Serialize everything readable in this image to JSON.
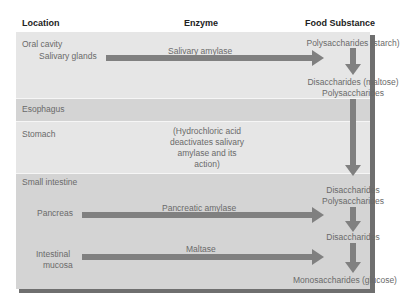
{
  "headers": {
    "location": "Location",
    "enzyme": "Enzyme",
    "food_substance": "Food Substance"
  },
  "regions": {
    "oral_cavity": {
      "label": "Oral cavity",
      "source": "Salivary glands",
      "enzyme": "Salivary amylase",
      "input": "Polysaccharides (starch)",
      "output_line1": "Disaccharides (maltose)",
      "output_line2": "Polysaccharides"
    },
    "esophagus": {
      "label": "Esophagus"
    },
    "stomach": {
      "label": "Stomach",
      "note_lines": [
        "(Hydrochloric acid",
        "deactivates salivary",
        "amylase and its",
        "action)"
      ]
    },
    "small_intestine": {
      "label": "Small intestine",
      "input_line1": "Disaccharides",
      "input_line2": "Polysaccharides",
      "pancreas": {
        "source": "Pancreas",
        "enzyme": "Pancreatic amylase",
        "output": "Disaccharides"
      },
      "intestinal_mucosa": {
        "source_line1": "Intestinal",
        "source_line2": "mucosa",
        "enzyme": "Maltase",
        "output": "Monosaccharides (glucose)"
      }
    }
  },
  "colors": {
    "band_light": "#e6e6e6",
    "band_dark": "#d4d4d4",
    "arrow": "#808080",
    "shadow": "#6f6f6f",
    "header_text": "#222222",
    "body_text": "#6a6a6a"
  }
}
